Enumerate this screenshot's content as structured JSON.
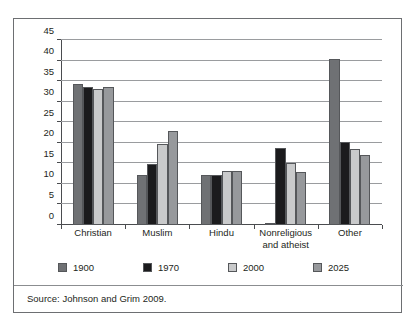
{
  "chart_data": {
    "type": "bar",
    "title": "",
    "subtitle": "",
    "xlabel": "",
    "ylabel": "",
    "ylim": [
      0,
      45
    ],
    "yticks": [
      0,
      5,
      10,
      15,
      20,
      25,
      30,
      35,
      40,
      45
    ],
    "grid": true,
    "legend_position": "bottom",
    "categories": [
      "Christian",
      "Muslim",
      "Hindu",
      "Nonreligious and atheist",
      "Other"
    ],
    "category_labels": [
      [
        "Christian"
      ],
      [
        "Muslim"
      ],
      [
        "Hindu"
      ],
      [
        "Nonreligious",
        "and atheist"
      ],
      [
        "Other"
      ]
    ],
    "series": [
      {
        "name": "1900",
        "color": "#6f7174",
        "values": [
          34.3,
          12.1,
          12.1,
          0.2,
          40.5
        ]
      },
      {
        "name": "1970",
        "color": "#1b1b1d",
        "values": [
          33.5,
          14.9,
          12.1,
          18.8,
          20.2
        ]
      },
      {
        "name": "2000",
        "color": "#c9cacb",
        "values": [
          33.0,
          19.6,
          13.2,
          15.0,
          18.5
        ]
      },
      {
        "name": "2025",
        "color": "#97999c",
        "values": [
          33.5,
          22.8,
          13.2,
          13.0,
          17.0
        ]
      }
    ]
  },
  "source": {
    "text": "Source: Johnson and Grim 2009."
  },
  "colors": {
    "frame_border": "#6d6f72",
    "gridline": "#9a9c9f",
    "axis": "#4a4c4f",
    "text": "#1d1f21"
  }
}
